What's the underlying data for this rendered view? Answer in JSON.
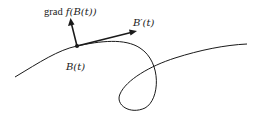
{
  "diagram": {
    "labels": {
      "gradient_word": "grad",
      "gradient_function": "f(B(t))",
      "tangent": "B′(t)",
      "point": "B(t)"
    },
    "colors": {
      "stroke": "#1a1a1a",
      "background": "#ffffff"
    },
    "elements": [
      {
        "type": "curve",
        "description": "smooth curve with a single loop"
      },
      {
        "type": "point",
        "label": "B(t)",
        "x": 77,
        "y": 46
      },
      {
        "type": "vector",
        "label": "grad f(B(t))",
        "from": [
          77,
          46
        ],
        "to": [
          71,
          20
        ]
      },
      {
        "type": "vector",
        "label": "B′(t)",
        "from": [
          77,
          46
        ],
        "to": [
          136,
          31
        ]
      }
    ]
  }
}
